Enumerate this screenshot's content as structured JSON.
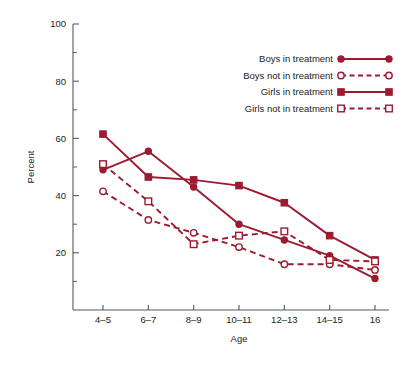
{
  "chart_data": {
    "type": "line",
    "title": "",
    "xlabel": "Age",
    "ylabel": "Percent",
    "categories": [
      "4–5",
      "6–7",
      "8–9",
      "10–11",
      "12–13",
      "14–15",
      "16"
    ],
    "ylim": [
      0,
      100
    ],
    "yticks_major": [
      20,
      40,
      60,
      80,
      100
    ],
    "yticks_minor": [
      10,
      30,
      50,
      70,
      90
    ],
    "ytick_labels": [
      "20",
      "40",
      "60",
      "80",
      "100"
    ],
    "grid": false,
    "legend_position": "top-right",
    "accent_color": "#9B1B30",
    "axis_color": "#555a5e",
    "series": [
      {
        "name": "Boys in treatment",
        "marker": "filled-circle",
        "linestyle": "solid",
        "color": "#9B1B30",
        "values": [
          49,
          55.5,
          43,
          30,
          24.5,
          19,
          11
        ]
      },
      {
        "name": "Boys not in treatment",
        "marker": "open-circle",
        "linestyle": "dashed",
        "color": "#9B1B30",
        "values": [
          41.5,
          31.5,
          27,
          22,
          16,
          16,
          14
        ]
      },
      {
        "name": "Girls in treatment",
        "marker": "filled-square",
        "linestyle": "solid",
        "color": "#9B1B30",
        "values": [
          61.5,
          46.5,
          45.5,
          43.5,
          37.5,
          26,
          17.5
        ]
      },
      {
        "name": "Girls not in treatment",
        "marker": "open-square",
        "linestyle": "dashed",
        "color": "#9B1B30",
        "values": [
          51,
          38,
          23,
          26,
          27.5,
          17.5,
          17
        ]
      }
    ]
  }
}
